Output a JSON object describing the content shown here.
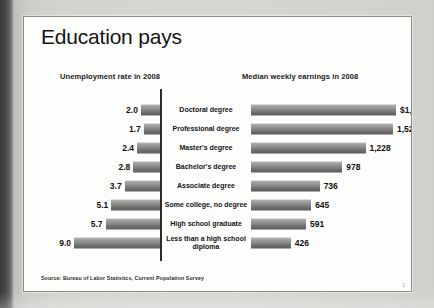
{
  "slide": {
    "title": "Education pays",
    "source": "Source: Bureau of Labor Statistics, Current Population Survey",
    "page_number": "1"
  },
  "headings": {
    "left": "Unemployment rate in 2008",
    "right": "Median weekly earnings in 2008"
  },
  "colors": {
    "bar_light": "#b9b9b7",
    "bar_dark": "#5e5e5c",
    "slide_bg": "#fdfdfc",
    "text": "#141414",
    "axis": "#2b2b2b"
  },
  "chart_data": {
    "type": "bar",
    "title": "Education pays",
    "orientation": "horizontal",
    "categories": [
      "Doctoral degree",
      "Professional degree",
      "Master's degree",
      "Bachelor's degree",
      "Associate degree",
      "Some college, no degree",
      "High school graduate",
      "Less than a high school diploma"
    ],
    "series": [
      {
        "name": "Unemployment rate in 2008",
        "unit": "percent",
        "direction": "left",
        "values": [
          2.0,
          1.7,
          2.4,
          2.8,
          3.7,
          5.1,
          5.7,
          9.0
        ],
        "labels": [
          "2.0",
          "1.7",
          "2.4",
          "2.8",
          "3.7",
          "5.1",
          "5.7",
          "9.0"
        ],
        "axis_max": 9.0
      },
      {
        "name": "Median weekly earnings in 2008",
        "unit": "US dollars",
        "direction": "right",
        "values": [
          1555,
          1522,
          1228,
          978,
          736,
          645,
          591,
          426
        ],
        "labels": [
          "$1,555",
          "1,522",
          "1,228",
          "978",
          "736",
          "645",
          "591",
          "426"
        ],
        "axis_max": 1555
      }
    ],
    "xlabel": "",
    "ylabel": "",
    "grid": false,
    "legend": "none"
  }
}
